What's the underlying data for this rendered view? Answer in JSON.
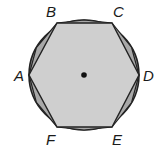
{
  "diagram": {
    "center": {
      "x": 84,
      "y": 75
    },
    "radius": 55,
    "vertices": [
      {
        "label": "A",
        "x": 29,
        "y": 75
      },
      {
        "label": "B",
        "x": 57,
        "y": 23
      },
      {
        "label": "C",
        "x": 112,
        "y": 23
      },
      {
        "label": "D",
        "x": 139,
        "y": 75
      },
      {
        "label": "E",
        "x": 112,
        "y": 127
      },
      {
        "label": "F",
        "x": 57,
        "y": 127
      }
    ],
    "colors": {
      "circle_fill": "#9a9a9a",
      "triangle_fill": "#a8a8a8",
      "hexagon_fill": "#cfcfcf",
      "stroke": "#222222"
    }
  },
  "labels": {
    "A": "A",
    "B": "B",
    "C": "C",
    "D": "D",
    "E": "E",
    "F": "F"
  }
}
